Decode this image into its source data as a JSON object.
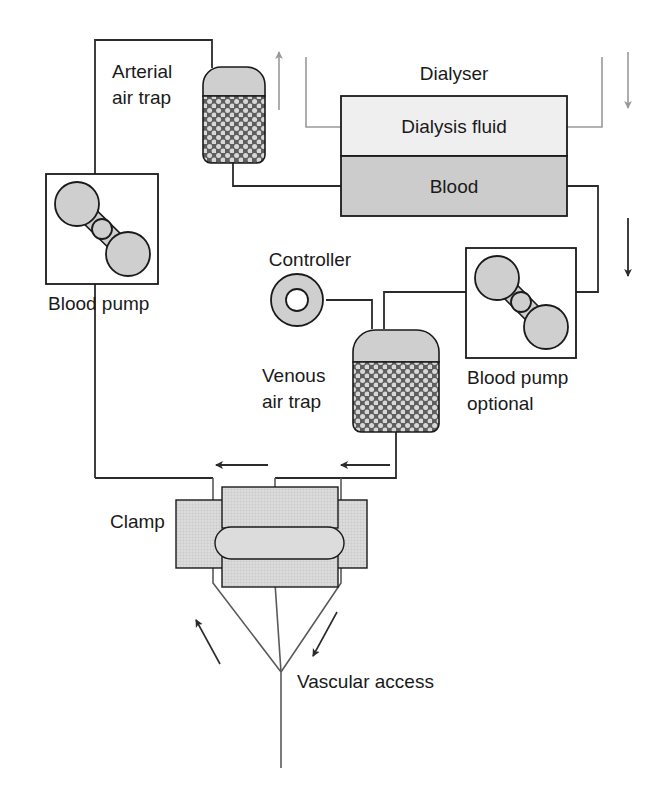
{
  "diagram": {
    "type": "schematic-flow-diagram",
    "canvas": {
      "width": 647,
      "height": 789,
      "background": "#ffffff"
    }
  },
  "colors": {
    "line_blood": "#2b2b2b",
    "line_dialysate": "#9a9a9a",
    "fill_light": "#efefef",
    "fill_mid": "#d2d2d2",
    "fill_dark": "#bdbdbd",
    "stroke_dark": "#1a1a1a",
    "text": "#1a1a1a",
    "arrow_blood": "#2b2b2b",
    "arrow_dialysate": "#9a9a9a"
  },
  "labels": {
    "arterial_air_trap_line1": "Arterial",
    "arterial_air_trap_line2": "air trap",
    "dialyser": "Dialyser",
    "dialysis_fluid": "Dialysis fluid",
    "blood": "Blood",
    "blood_pump": "Blood pump",
    "controller": "Controller",
    "venous_air_trap_line1": "Venous",
    "venous_air_trap_line2": "air trap",
    "blood_pump_optional_line1": "Blood pump",
    "blood_pump_optional_line2": "optional",
    "clamp": "Clamp",
    "vascular_access": "Vascular access"
  },
  "components": [
    {
      "name": "arterial-air-trap",
      "label": "Arterial air trap",
      "shape": "domed-cylinder",
      "fill": "stippled"
    },
    {
      "name": "blood-pump",
      "label": "Blood pump",
      "shape": "boxed-roller-pump"
    },
    {
      "name": "dialyser",
      "label": "Dialyser",
      "shape": "two-chamber-box",
      "chambers": [
        "Dialysis fluid",
        "Blood"
      ]
    },
    {
      "name": "controller",
      "label": "Controller",
      "shape": "annulus"
    },
    {
      "name": "venous-air-trap",
      "label": "Venous air trap",
      "shape": "domed-cylinder",
      "fill": "stippled"
    },
    {
      "name": "blood-pump-optional",
      "label": "Blood pump optional",
      "shape": "boxed-roller-pump"
    },
    {
      "name": "clamp",
      "label": "Clamp",
      "shape": "jaw-blocks"
    },
    {
      "name": "vascular-access",
      "label": "Vascular access",
      "shape": "y-junction"
    }
  ],
  "flow_arrows": [
    {
      "name": "dialysate-inlet-arrow",
      "direction": "up",
      "color": "#9a9a9a"
    },
    {
      "name": "dialysate-outlet-arrow",
      "direction": "down",
      "color": "#9a9a9a"
    },
    {
      "name": "blood-return-arrow-right",
      "direction": "down",
      "color": "#2b2b2b"
    },
    {
      "name": "blood-return-arrow-mid",
      "direction": "left",
      "color": "#2b2b2b"
    },
    {
      "name": "blood-return-arrow-left",
      "direction": "left",
      "color": "#2b2b2b"
    },
    {
      "name": "access-draw-arrow",
      "direction": "up-left",
      "color": "#2b2b2b"
    },
    {
      "name": "access-return-arrow",
      "direction": "down-left",
      "color": "#2b2b2b"
    }
  ]
}
